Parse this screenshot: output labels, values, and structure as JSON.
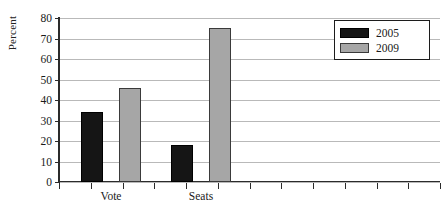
{
  "chart_data": {
    "type": "bar",
    "title": "",
    "subtitle": "",
    "xlabel": "",
    "ylabel": "Percent",
    "categories": [
      "Vote",
      "Seats"
    ],
    "series": [
      {
        "name": "2005",
        "color": "#151515",
        "values": [
          34,
          18
        ]
      },
      {
        "name": "2009",
        "color": "#a6a6a6",
        "values": [
          46,
          75
        ]
      }
    ],
    "ylim": [
      0,
      80
    ],
    "ytick_step": 10,
    "yticks": [
      80,
      70,
      60,
      50,
      40,
      30,
      20,
      10,
      0
    ],
    "ytick_labels": [
      "80",
      "70",
      "60",
      "50",
      "40",
      "30",
      "20",
      "10",
      "0"
    ],
    "grid": true,
    "grid_axis": "y",
    "legend_position": "top-right",
    "legend_entries": [
      "2005",
      "2009"
    ],
    "annotations": []
  },
  "axes": {
    "y_title": "Percent",
    "x_tick_count": 12
  },
  "legend": {
    "entries": [
      {
        "label": "2005",
        "swatch": "black-square-swatch"
      },
      {
        "label": "2009",
        "swatch": "gray-square-swatch"
      }
    ]
  }
}
